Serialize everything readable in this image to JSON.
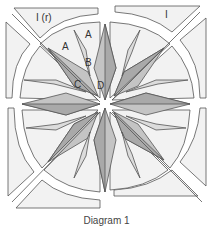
{
  "diagram": {
    "caption": "Diagram 1",
    "labels": {
      "corner_top_left": "I (r)",
      "corner_top_right": "I",
      "a1": "A",
      "a2": "A",
      "b": "B",
      "c": "C",
      "d": "D"
    },
    "colors": {
      "outline": "#555555",
      "background_piece": "#f2f2f2",
      "dark_point": "#a9a9a9",
      "mid_point": "#c4c4c4",
      "light_point": "#dcdcdc"
    }
  }
}
